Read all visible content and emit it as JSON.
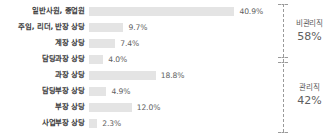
{
  "chart_data": {
    "type": "bar",
    "orientation": "horizontal",
    "title": "",
    "xlabel": "",
    "ylabel": "",
    "xlim": [
      0,
      45
    ],
    "grid": false,
    "legend": "none",
    "value_suffix": "%",
    "categories": [
      "일반사원, 종업원",
      "주임, 리더, 반장 상당",
      "계장 상당",
      "담당과장 상당",
      "과장 상당",
      "담당부장 상당",
      "부장 상당",
      "사업부장 상당"
    ],
    "values": [
      40.9,
      9.7,
      7.4,
      4.0,
      18.8,
      4.9,
      12.0,
      2.3
    ],
    "value_labels": [
      "40.9%",
      "9.7%",
      "7.4%",
      "4.0%",
      "18.8%",
      "4.9%",
      "12.0%",
      "2.3%"
    ],
    "bar_color": "#e4e4e4",
    "annotations": [
      {
        "id": "nonmanagerial",
        "name": "비관리직",
        "percent": "58%",
        "covers": [
          0,
          1,
          2,
          3
        ]
      },
      {
        "id": "managerial",
        "name": "관리직",
        "percent": "42%",
        "covers": [
          4,
          5,
          6,
          7
        ]
      }
    ]
  }
}
